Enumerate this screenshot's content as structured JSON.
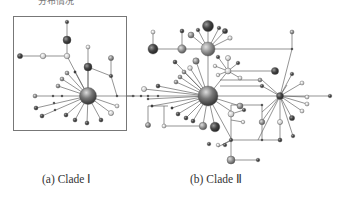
{
  "figure": {
    "top_text_fragment": "分布情况",
    "panels": [
      {
        "id": "a",
        "caption": "(a) Clade Ⅰ"
      },
      {
        "id": "b",
        "caption": "(b) Clade Ⅱ"
      }
    ],
    "colors": {
      "edge": "#666666",
      "node_dark": "#3a3a3a",
      "node_mid": "#8a8a8a",
      "node_light": "#d8d8d8",
      "frame": "#777777"
    }
  }
}
